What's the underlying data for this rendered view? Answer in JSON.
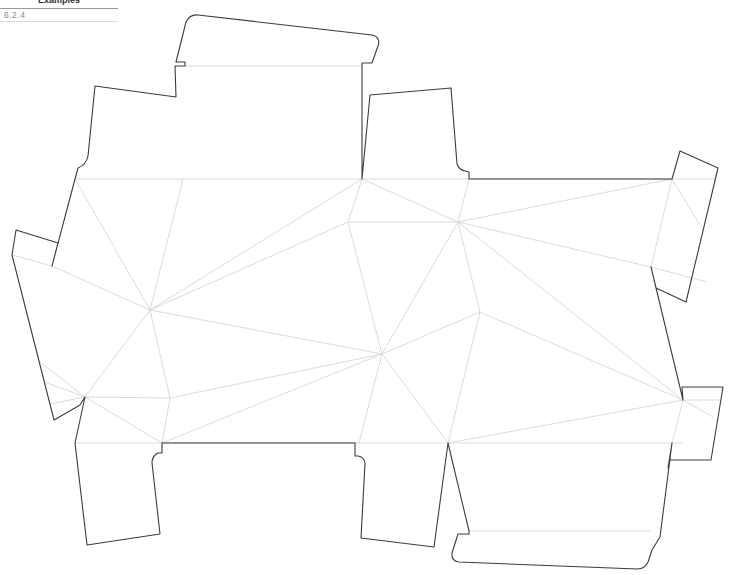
{
  "header": {
    "title": "Examples",
    "section": "6.2.4"
  },
  "diagram": {
    "type": "packaging-dieline",
    "cut_line_color": "#3c3c3c",
    "fold_line_color": "#d6d6d6",
    "background": "#ffffff"
  }
}
